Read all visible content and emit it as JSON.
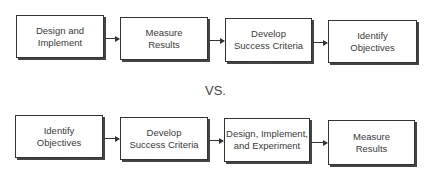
{
  "top_row": {
    "steps": [
      {
        "label": "Design and\nImplement"
      },
      {
        "label": "Measure\nResults"
      },
      {
        "label": "Develop\nSuccess Criteria"
      },
      {
        "label": "Identify\nObjectives"
      }
    ]
  },
  "separator": {
    "label": "VS."
  },
  "bottom_row": {
    "steps": [
      {
        "label": "Identify\nObjectives"
      },
      {
        "label": "Develop\nSuccess Criteria"
      },
      {
        "label": "Design, Implement,\nand Experiment"
      },
      {
        "label": "Measure\nResults"
      }
    ]
  }
}
